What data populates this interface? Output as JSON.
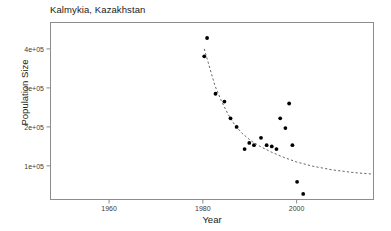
{
  "chart_data": {
    "type": "scatter",
    "title": "Kalmykia, Kazakhstan",
    "xlabel": "Year",
    "ylabel": "Population Size",
    "xlim": [
      1947.4,
      2016.5
    ],
    "ylim": [
      12500,
      469000
    ],
    "grid": false,
    "legend": null,
    "xticks": [
      1960,
      1980,
      2000
    ],
    "xtick_labels": [
      "1960",
      "1980",
      "2000"
    ],
    "yticks": [
      100000,
      200000,
      300000,
      400000
    ],
    "ytick_labels": [
      "1e+05",
      "2e+05",
      "3e+05",
      "4e+05"
    ],
    "series": [
      {
        "name": "observed-population",
        "type": "scatter",
        "marker": "filled-circle",
        "color": "#000000",
        "points": [
          {
            "x": 1980.9,
            "y": 428000
          },
          {
            "x": 1980.3,
            "y": 381000
          },
          {
            "x": 1982.7,
            "y": 285000
          },
          {
            "x": 1984.6,
            "y": 265000
          },
          {
            "x": 1985.9,
            "y": 222000
          },
          {
            "x": 1987.2,
            "y": 200000
          },
          {
            "x": 1988.9,
            "y": 143000
          },
          {
            "x": 1989.9,
            "y": 159000
          },
          {
            "x": 1990.9,
            "y": 153000
          },
          {
            "x": 1992.4,
            "y": 172000
          },
          {
            "x": 1993.6,
            "y": 153000
          },
          {
            "x": 1994.7,
            "y": 150000
          },
          {
            "x": 1995.7,
            "y": 143000
          },
          {
            "x": 1998.4,
            "y": 260000
          },
          {
            "x": 1996.5,
            "y": 222000
          },
          {
            "x": 1997.6,
            "y": 197000
          },
          {
            "x": 1999.1,
            "y": 153000
          },
          {
            "x": 2000.1,
            "y": 59000
          },
          {
            "x": 2001.4,
            "y": 28000
          }
        ]
      },
      {
        "name": "fitted-decline-curve",
        "type": "line",
        "style": "dashed",
        "color": "#555555",
        "points": [
          {
            "x": 1980.3,
            "y": 400000
          },
          {
            "x": 1981.5,
            "y": 350000
          },
          {
            "x": 1982.6,
            "y": 305000
          },
          {
            "x": 1983.9,
            "y": 268000
          },
          {
            "x": 1985.3,
            "y": 234000
          },
          {
            "x": 1986.8,
            "y": 205000
          },
          {
            "x": 1988.4,
            "y": 183000
          },
          {
            "x": 1990.2,
            "y": 165000
          },
          {
            "x": 1992.2,
            "y": 150000
          },
          {
            "x": 1994.5,
            "y": 136000
          },
          {
            "x": 1997.0,
            "y": 123000
          },
          {
            "x": 2000.0,
            "y": 110000
          },
          {
            "x": 2003.5,
            "y": 99000
          },
          {
            "x": 2007.5,
            "y": 90000
          },
          {
            "x": 2012.0,
            "y": 83000
          },
          {
            "x": 2016.0,
            "y": 79000
          }
        ]
      }
    ]
  },
  "colors": {
    "marker": "#000000",
    "curve": "#555555",
    "frame": "#8c8c8c",
    "text": "#1a1a1a",
    "background": "#ffffff"
  }
}
